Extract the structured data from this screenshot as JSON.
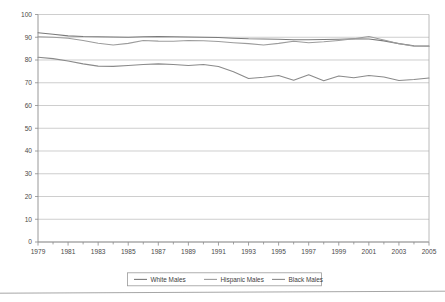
{
  "chart_data": {
    "type": "line",
    "title": "",
    "xlabel": "",
    "ylabel": "",
    "xlim": [
      1979,
      2005
    ],
    "ylim": [
      0,
      100
    ],
    "grid": true,
    "legend_position": "bottom",
    "x": [
      1979,
      1980,
      1981,
      1982,
      1983,
      1984,
      1985,
      1986,
      1987,
      1988,
      1989,
      1990,
      1991,
      1992,
      1993,
      1994,
      1995,
      1996,
      1997,
      1998,
      1999,
      2000,
      2001,
      2002,
      2003,
      2004,
      2005
    ],
    "xtick_labels": [
      "1979",
      "1981",
      "1983",
      "1985",
      "1987",
      "1989",
      "1991",
      "1993",
      "1995",
      "1997",
      "1999",
      "2001",
      "2003",
      "2005"
    ],
    "xtick_values": [
      1979,
      1981,
      1983,
      1985,
      1987,
      1989,
      1991,
      1993,
      1995,
      1997,
      1999,
      2001,
      2003,
      2005
    ],
    "ytick_labels": [
      "0",
      "10",
      "20",
      "30",
      "40",
      "50",
      "60",
      "70",
      "80",
      "90",
      "100"
    ],
    "ytick_values": [
      0,
      10,
      20,
      30,
      40,
      50,
      60,
      70,
      80,
      90,
      100
    ],
    "series": [
      {
        "name": "White Males",
        "color": "#7a7a7a",
        "values": [
          92.0,
          91.3,
          90.6,
          90.3,
          90.2,
          90.1,
          90.0,
          90.2,
          90.3,
          90.2,
          90.1,
          90.0,
          89.9,
          89.6,
          89.3,
          89.2,
          89.1,
          88.9,
          88.9,
          89.0,
          89.1,
          89.3,
          89.2,
          88.4,
          87.2,
          86.3,
          86.2
        ]
      },
      {
        "name": "Hispanic Males",
        "color": "#9c9c9c",
        "values": [
          90.2,
          90.0,
          89.6,
          88.6,
          87.4,
          86.6,
          87.3,
          88.6,
          88.3,
          88.2,
          88.6,
          88.5,
          88.1,
          87.6,
          87.2,
          86.6,
          87.3,
          88.2,
          87.6,
          88.0,
          88.6,
          89.3,
          90.3,
          88.8,
          87.1,
          86.1,
          86.0
        ]
      },
      {
        "name": "Black Males",
        "color": "#8a8a8a",
        "values": [
          81.2,
          80.6,
          79.6,
          78.3,
          77.3,
          77.2,
          77.6,
          78.0,
          78.3,
          78.0,
          77.6,
          78.0,
          77.1,
          74.8,
          71.9,
          72.4,
          73.2,
          71.1,
          73.5,
          70.9,
          73.0,
          72.2,
          73.2,
          72.5,
          71.0,
          71.4,
          72.1
        ]
      }
    ]
  },
  "legend": {
    "items": [
      {
        "label": "White Males"
      },
      {
        "label": "Hispanic Males"
      },
      {
        "label": "Black Males"
      }
    ]
  },
  "colors": {
    "white_males": "#7a7a7a",
    "hispanic_males": "#9c9c9c",
    "black_males": "#8a8a8a",
    "grid": "#b9b9b9",
    "axis": "#8c8c8c",
    "background": "#ffffff"
  }
}
